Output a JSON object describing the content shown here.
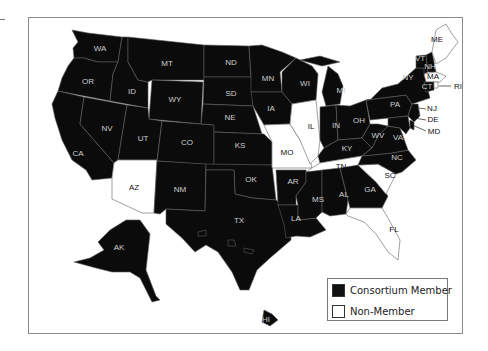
{
  "map": {
    "title": "",
    "colors": {
      "member": "#0b0b0b",
      "non_member": "#ffffff",
      "border": "#8a8a8a"
    },
    "legend": {
      "items": [
        {
          "label": "Consortium Member",
          "color": "#0b0b0b"
        },
        {
          "label": "Non-Member",
          "color": "#ffffff"
        }
      ]
    },
    "states": {
      "WA": {
        "label": "WA",
        "member": true
      },
      "OR": {
        "label": "OR",
        "member": true
      },
      "CA": {
        "label": "CA",
        "member": true
      },
      "ID": {
        "label": "ID",
        "member": true
      },
      "NV": {
        "label": "NV",
        "member": true
      },
      "MT": {
        "label": "MT",
        "member": true
      },
      "WY": {
        "label": "WY",
        "member": true
      },
      "UT": {
        "label": "UT",
        "member": true
      },
      "AZ": {
        "label": "AZ",
        "member": false
      },
      "CO": {
        "label": "CO",
        "member": true
      },
      "NM": {
        "label": "NM",
        "member": true
      },
      "ND": {
        "label": "ND",
        "member": true
      },
      "SD": {
        "label": "SD",
        "member": true
      },
      "NE": {
        "label": "NE",
        "member": true
      },
      "KS": {
        "label": "KS",
        "member": true
      },
      "OK": {
        "label": "OK",
        "member": true
      },
      "TX": {
        "label": "TX",
        "member": true
      },
      "MN": {
        "label": "MN",
        "member": true
      },
      "IA": {
        "label": "IA",
        "member": true
      },
      "MO": {
        "label": "MO",
        "member": false
      },
      "AR": {
        "label": "AR",
        "member": true
      },
      "LA": {
        "label": "LA",
        "member": true
      },
      "WI": {
        "label": "WI",
        "member": true
      },
      "IL": {
        "label": "IL",
        "member": false
      },
      "MI": {
        "label": "MI",
        "member": true
      },
      "IN": {
        "label": "IN",
        "member": true
      },
      "OH": {
        "label": "OH",
        "member": true
      },
      "KY": {
        "label": "KY",
        "member": true
      },
      "TN": {
        "label": "TN",
        "member": false
      },
      "MS": {
        "label": "MS",
        "member": true
      },
      "AL": {
        "label": "AL",
        "member": true
      },
      "GA": {
        "label": "GA",
        "member": true
      },
      "FL": {
        "label": "FL",
        "member": false
      },
      "SC": {
        "label": "SC",
        "member": false
      },
      "NC": {
        "label": "NC",
        "member": true
      },
      "VA": {
        "label": "VA",
        "member": true
      },
      "WV": {
        "label": "WV",
        "member": true
      },
      "PA": {
        "label": "PA",
        "member": true
      },
      "NY": {
        "label": "NY",
        "member": true
      },
      "NJ": {
        "label": "NJ",
        "member": true
      },
      "DE": {
        "label": "DE",
        "member": true
      },
      "MD": {
        "label": "MD",
        "member": true
      },
      "VT": {
        "label": "VT",
        "member": true
      },
      "NH": {
        "label": "NH",
        "member": true
      },
      "MA": {
        "label": "MA",
        "member": false
      },
      "CT": {
        "label": "CT",
        "member": true
      },
      "RI": {
        "label": "RI",
        "member": false
      },
      "ME": {
        "label": "ME",
        "member": false
      },
      "AK": {
        "label": "AK",
        "member": true
      },
      "HI": {
        "label": "HI",
        "member": true
      }
    }
  }
}
